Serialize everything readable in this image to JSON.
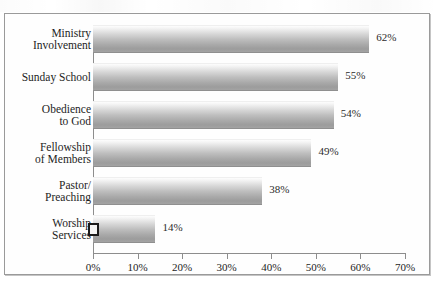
{
  "chart_data": {
    "type": "bar",
    "orientation": "horizontal",
    "title": "",
    "xlabel": "",
    "ylabel": "",
    "xlim": [
      0,
      70
    ],
    "xtick_labels": [
      "0%",
      "10%",
      "20%",
      "30%",
      "40%",
      "50%",
      "60%",
      "70%"
    ],
    "xtick_values": [
      0,
      10,
      20,
      30,
      40,
      50,
      60,
      70
    ],
    "grid": false,
    "legend": false,
    "categories": [
      "Ministry\nInvolvement",
      "Sunday School",
      "Obedience\nto God",
      "Fellowship\nof Members",
      "Pastor/\nPreaching",
      "Worship\nServices"
    ],
    "values": [
      62,
      55,
      54,
      49,
      38,
      14
    ],
    "value_labels": [
      "62%",
      "55%",
      "54%",
      "49%",
      "38%",
      "14%"
    ]
  },
  "annotations": {
    "selection_handle": "selection-handle"
  },
  "colors": {
    "frame_border": "#9a9a9a",
    "axis": "#8d8d8d",
    "bar_light": "#fdfdfd",
    "bar_dark": "#9c9c9c",
    "text": "#1d1d1d",
    "background": "#ffffff"
  }
}
